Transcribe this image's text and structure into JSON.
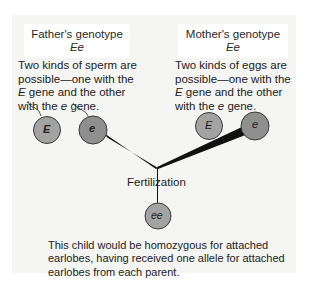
{
  "father": {
    "title": "Father's genotype",
    "genotype": "Ee",
    "desc_pre": "Two kinds of sperm are possible—one with the ",
    "allele_dominant": "E",
    "desc_mid": " gene and the other with the ",
    "allele_recessive": "e",
    "desc_post": " gene.",
    "gametes": [
      "E",
      "e"
    ]
  },
  "mother": {
    "title": "Mother's genotype",
    "genotype": "Ee",
    "desc_pre": "Two kinds of eggs are possible—one with the ",
    "allele_dominant": "E",
    "desc_mid": " gene and the other with the ",
    "allele_recessive": "e",
    "desc_post": " gene.",
    "gametes": [
      "E",
      "e"
    ]
  },
  "fertilization_label": "Fertilization",
  "child": {
    "genotype": "ee",
    "description": "This child would be homozygous for attached earlobes, having received one allele for attached earlobes from each parent."
  },
  "colors": {
    "panel": "#f5f5f4",
    "gamete_fill": "#9a9a9a",
    "gamete_stroke": "#3a3a3a",
    "line": "#111111"
  }
}
